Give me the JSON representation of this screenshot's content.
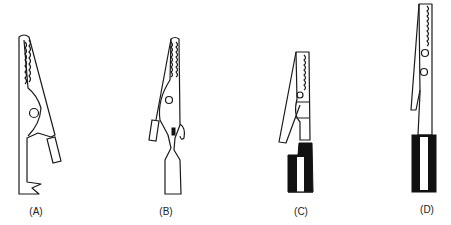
{
  "figure": {
    "items": [
      {
        "id": "A",
        "label": "(A)"
      },
      {
        "id": "B",
        "label": "(B)"
      },
      {
        "id": "C",
        "label": "(C)"
      },
      {
        "id": "D",
        "label": "(D)"
      }
    ]
  }
}
